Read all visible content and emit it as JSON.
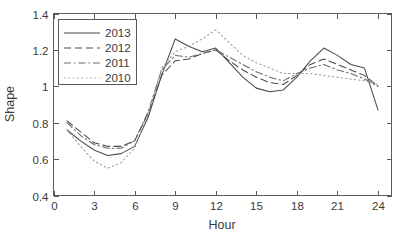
{
  "chart_data": {
    "type": "line",
    "title": "",
    "xlabel": "Hour",
    "ylabel": "Shape",
    "xlim": [
      0,
      25
    ],
    "ylim": [
      0.4,
      1.4
    ],
    "xticks": [
      0,
      3,
      6,
      9,
      12,
      15,
      18,
      21,
      24
    ],
    "yticks": [
      "0.4",
      "0.6",
      "0.8",
      "1",
      "1.2",
      "1.4"
    ],
    "grid": false,
    "legend_position": "top-left",
    "x": [
      1,
      2,
      3,
      4,
      5,
      6,
      7,
      8,
      9,
      10,
      11,
      12,
      13,
      14,
      15,
      16,
      17,
      18,
      19,
      20,
      21,
      22,
      23,
      24
    ],
    "series": [
      {
        "name": "2013",
        "linestyle": "solid",
        "color": "#4a4a4a",
        "values": [
          0.76,
          0.7,
          0.65,
          0.62,
          0.63,
          0.67,
          0.83,
          1.06,
          1.26,
          1.22,
          1.19,
          1.21,
          1.13,
          1.05,
          0.99,
          0.97,
          0.98,
          1.05,
          1.14,
          1.21,
          1.17,
          1.12,
          1.1,
          0.87
        ]
      },
      {
        "name": "2012",
        "linestyle": "dashed",
        "color": "#4a4a4a",
        "values": [
          0.81,
          0.75,
          0.69,
          0.67,
          0.67,
          0.7,
          0.85,
          1.06,
          1.14,
          1.15,
          1.18,
          1.2,
          1.14,
          1.09,
          1.05,
          1.02,
          1.01,
          1.06,
          1.12,
          1.15,
          1.12,
          1.09,
          1.06,
          1.0
        ]
      },
      {
        "name": "2011",
        "linestyle": "dashdot",
        "color": "#6a6a6a",
        "values": [
          0.8,
          0.73,
          0.68,
          0.66,
          0.66,
          0.7,
          0.86,
          1.09,
          1.17,
          1.16,
          1.18,
          1.2,
          1.16,
          1.12,
          1.08,
          1.05,
          1.03,
          1.07,
          1.1,
          1.12,
          1.09,
          1.07,
          1.04,
          1.0
        ]
      },
      {
        "name": "2010",
        "linestyle": "dotted",
        "color": "#9a9a9a",
        "values": [
          0.76,
          0.67,
          0.59,
          0.55,
          0.58,
          0.66,
          0.85,
          1.1,
          1.19,
          1.22,
          1.26,
          1.31,
          1.24,
          1.17,
          1.13,
          1.1,
          1.07,
          1.07,
          1.07,
          1.06,
          1.05,
          1.04,
          1.03,
          1.01
        ]
      }
    ]
  },
  "axes": {
    "y_label": "Shape",
    "x_label": "Hour",
    "y_tick_labels": [
      "0.4",
      "0.6",
      "0.8",
      "1",
      "1.2",
      "1.4"
    ],
    "x_tick_labels": [
      "0",
      "3",
      "6",
      "9",
      "12",
      "15",
      "18",
      "21",
      "24"
    ]
  },
  "legend": {
    "entries": [
      {
        "label": "2013"
      },
      {
        "label": "2012"
      },
      {
        "label": "2011"
      },
      {
        "label": "2010"
      }
    ]
  }
}
